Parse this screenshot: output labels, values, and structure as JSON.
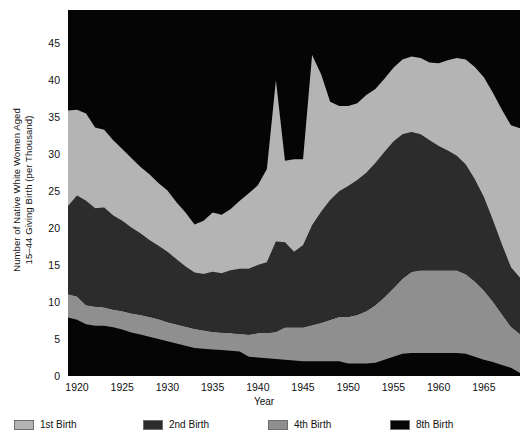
{
  "chart_data": {
    "type": "area",
    "title": "",
    "xlabel": "Year",
    "ylabel": "Number of Native White Women Aged 15–44 Giving Birth (per Thousand)",
    "ylabel_line1": "Number of Native White Women Aged",
    "ylabel_line2": "15–44 Giving Birth (per Thousand)",
    "stacked": true,
    "grid": false,
    "legend_position": "bottom",
    "xlim": [
      1919,
      1969
    ],
    "ylim": [
      0,
      49.5
    ],
    "yticks": [
      0,
      5,
      10,
      15,
      20,
      25,
      30,
      35,
      40,
      45
    ],
    "xticks": [
      1920,
      1925,
      1930,
      1935,
      1940,
      1945,
      1950,
      1955,
      1960,
      1965
    ],
    "x": [
      1919,
      1920,
      1921,
      1922,
      1923,
      1924,
      1925,
      1926,
      1927,
      1928,
      1929,
      1930,
      1931,
      1932,
      1933,
      1934,
      1935,
      1936,
      1937,
      1938,
      1939,
      1940,
      1941,
      1942,
      1943,
      1944,
      1945,
      1946,
      1947,
      1948,
      1949,
      1950,
      1951,
      1952,
      1953,
      1954,
      1955,
      1956,
      1957,
      1958,
      1959,
      1960,
      1961,
      1962,
      1963,
      1964,
      1965,
      1966,
      1967,
      1968,
      1969
    ],
    "series": [
      {
        "name": "8th Birth",
        "color": "#050505",
        "stack_order": 1,
        "values": [
          7.9,
          7.6,
          7.0,
          6.8,
          6.8,
          6.6,
          6.3,
          5.9,
          5.6,
          5.3,
          5.0,
          4.7,
          4.4,
          4.1,
          3.8,
          3.7,
          3.6,
          3.5,
          3.4,
          3.3,
          2.6,
          2.5,
          2.4,
          2.3,
          2.2,
          2.1,
          2.0,
          2.0,
          2.0,
          2.0,
          2.0,
          1.7,
          1.7,
          1.7,
          1.8,
          2.2,
          2.6,
          3.0,
          3.1,
          3.1,
          3.1,
          3.1,
          3.1,
          3.1,
          3.0,
          2.6,
          2.2,
          1.9,
          1.5,
          1.1,
          0.4
        ]
      },
      {
        "name": "4th Birth",
        "color": "#8f8f8f",
        "stack_order": 2,
        "values": [
          3.2,
          3.2,
          2.6,
          2.6,
          2.5,
          2.4,
          2.5,
          2.6,
          2.7,
          2.7,
          2.7,
          2.6,
          2.6,
          2.6,
          2.6,
          2.5,
          2.4,
          2.4,
          2.4,
          2.4,
          3.0,
          3.3,
          3.4,
          3.7,
          4.4,
          4.5,
          4.6,
          4.9,
          5.2,
          5.6,
          6.0,
          6.3,
          6.6,
          7.1,
          7.8,
          8.5,
          9.3,
          10.2,
          11.0,
          11.2,
          11.2,
          11.2,
          11.2,
          11.2,
          10.8,
          10.2,
          9.4,
          8.2,
          6.9,
          5.6,
          5.3
        ]
      },
      {
        "name": "2nd Birth",
        "color": "#2c2c2c",
        "stack_order": 3,
        "values": [
          11.9,
          13.6,
          14.1,
          13.3,
          13.5,
          12.7,
          12.2,
          11.6,
          11.0,
          10.4,
          9.9,
          9.5,
          8.8,
          8.1,
          7.6,
          7.6,
          8.1,
          8.0,
          8.5,
          8.8,
          8.9,
          9.2,
          9.6,
          12.2,
          11.5,
          10.2,
          11.1,
          13.5,
          15.0,
          16.2,
          17.0,
          17.7,
          18.2,
          18.7,
          19.2,
          19.6,
          19.8,
          19.5,
          18.9,
          18.4,
          17.6,
          16.8,
          16.2,
          15.5,
          14.8,
          13.8,
          12.6,
          11.0,
          9.4,
          8.0,
          7.6
        ]
      },
      {
        "name": "1st Birth",
        "color": "#b4b4b4",
        "stack_order": 4,
        "values": [
          12.9,
          11.6,
          11.8,
          10.9,
          10.5,
          10.2,
          9.7,
          9.4,
          9.0,
          8.9,
          8.5,
          8.3,
          7.7,
          7.3,
          6.5,
          7.2,
          8.0,
          7.9,
          8.3,
          9.2,
          10.2,
          10.8,
          12.6,
          21.8,
          11.0,
          12.5,
          11.6,
          23.0,
          18.6,
          13.3,
          11.5,
          10.8,
          10.4,
          10.5,
          10.0,
          9.9,
          10.0,
          10.1,
          10.2,
          10.3,
          10.5,
          11.2,
          12.2,
          13.2,
          14.2,
          15.2,
          16.2,
          17.2,
          18.2,
          19.2,
          20.2
        ]
      }
    ],
    "legend": [
      {
        "label": "1st Birth",
        "color": "#b4b4b4"
      },
      {
        "label": "2nd Birth",
        "color": "#2c2c2c"
      },
      {
        "label": "4th Birth",
        "color": "#8f8f8f"
      },
      {
        "label": "8th Birth",
        "color": "#050505"
      }
    ],
    "background_color": "#050505",
    "figure_color": "#ffffff"
  }
}
